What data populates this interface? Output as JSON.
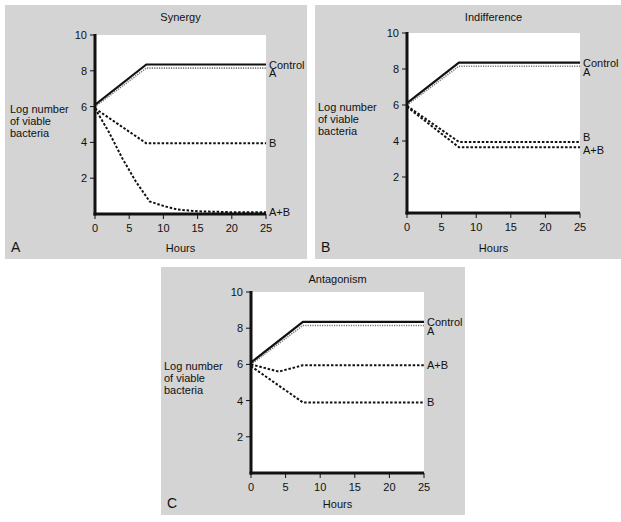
{
  "colors": {
    "panel_bg": "#d4d4d4",
    "plot_bg": "#ffffff",
    "line": "#111111",
    "line_light": "#777777"
  },
  "chart_data": [
    {
      "id": "A",
      "type": "line",
      "panel_label": "A",
      "title": "Synergy",
      "xlabel": "Hours",
      "ylabel": "Log number of viable bacteria",
      "ylabel_lines": [
        "Log number",
        "of viable",
        "bacteria"
      ],
      "xlim": [
        0,
        25
      ],
      "ylim": [
        0,
        10
      ],
      "xticks": [
        0,
        5,
        10,
        15,
        20,
        25
      ],
      "yticks": [
        2,
        4,
        6,
        8,
        10
      ],
      "grid": false,
      "series": [
        {
          "name": "Control",
          "style": "solid",
          "x": [
            0,
            7.5,
            25
          ],
          "y": [
            6.1,
            8.35,
            8.35
          ]
        },
        {
          "name": "A",
          "style": "dotted-light",
          "x": [
            0,
            7.5,
            25
          ],
          "y": [
            6.0,
            8.15,
            8.15
          ]
        },
        {
          "name": "B",
          "style": "dashed",
          "x": [
            0,
            7.5,
            25
          ],
          "y": [
            5.9,
            3.95,
            3.95
          ]
        },
        {
          "name": "A+B",
          "style": "dashed",
          "x": [
            0,
            2,
            4,
            6,
            8,
            10,
            12,
            15,
            20,
            25
          ],
          "y": [
            5.9,
            4.6,
            3.1,
            1.8,
            0.7,
            0.45,
            0.25,
            0.15,
            0.1,
            0.1
          ]
        }
      ],
      "series_labels": [
        {
          "text": "Control",
          "y": 8.35
        },
        {
          "text": "A",
          "y": 7.85
        },
        {
          "text": "B",
          "y": 3.95
        },
        {
          "text": "A+B",
          "y": 0.1
        }
      ]
    },
    {
      "id": "B",
      "type": "line",
      "panel_label": "B",
      "title": "Indifference",
      "xlabel": "Hours",
      "ylabel": "Log number of viable bacteria",
      "ylabel_lines": [
        "Log number",
        "of viable",
        "bacteria"
      ],
      "xlim": [
        0,
        25
      ],
      "ylim": [
        0,
        10
      ],
      "xticks": [
        0,
        5,
        10,
        15,
        20,
        25
      ],
      "yticks": [
        2,
        4,
        6,
        8,
        10
      ],
      "grid": false,
      "series": [
        {
          "name": "Control",
          "style": "solid",
          "x": [
            0,
            7.5,
            25
          ],
          "y": [
            6.1,
            8.35,
            8.35
          ]
        },
        {
          "name": "A",
          "style": "dotted-light",
          "x": [
            0,
            7.5,
            25
          ],
          "y": [
            6.0,
            8.15,
            8.15
          ]
        },
        {
          "name": "B",
          "style": "dashed",
          "x": [
            0,
            7.5,
            25
          ],
          "y": [
            5.95,
            3.95,
            3.95
          ]
        },
        {
          "name": "A+B",
          "style": "dashed",
          "x": [
            0,
            7.5,
            25
          ],
          "y": [
            5.9,
            3.65,
            3.65
          ]
        }
      ],
      "series_labels": [
        {
          "text": "Control",
          "y": 8.35
        },
        {
          "text": "A",
          "y": 7.85
        },
        {
          "text": "B",
          "y": 4.2
        },
        {
          "text": "A+B",
          "y": 3.5
        }
      ]
    },
    {
      "id": "C",
      "type": "line",
      "panel_label": "C",
      "title": "Antagonism",
      "xlabel": "Hours",
      "ylabel": "Log number of viable bacteria",
      "ylabel_lines": [
        "Log number",
        "of viable",
        "bacteria"
      ],
      "xlim": [
        0,
        25
      ],
      "ylim": [
        0,
        10
      ],
      "xticks": [
        0,
        5,
        10,
        15,
        20,
        25
      ],
      "yticks": [
        2,
        4,
        6,
        8,
        10
      ],
      "grid": false,
      "series": [
        {
          "name": "Control",
          "style": "solid",
          "x": [
            0,
            7.5,
            25
          ],
          "y": [
            6.1,
            8.35,
            8.35
          ]
        },
        {
          "name": "A",
          "style": "dotted-light",
          "x": [
            0,
            7.5,
            25
          ],
          "y": [
            6.0,
            8.15,
            8.15
          ]
        },
        {
          "name": "A+B",
          "style": "dashed",
          "x": [
            0,
            4,
            7.5,
            25
          ],
          "y": [
            6.0,
            5.6,
            5.95,
            5.95
          ]
        },
        {
          "name": "B",
          "style": "dashed",
          "x": [
            0,
            7.5,
            25
          ],
          "y": [
            5.9,
            3.9,
            3.9
          ]
        }
      ],
      "series_labels": [
        {
          "text": "Control",
          "y": 8.35
        },
        {
          "text": "A",
          "y": 7.85
        },
        {
          "text": "A+B",
          "y": 5.95
        },
        {
          "text": "B",
          "y": 3.9
        }
      ]
    }
  ],
  "layout": [
    {
      "panel": {
        "x": 5,
        "y": 5,
        "w": 302,
        "h": 254
      },
      "plot": {
        "x0": 95,
        "y0": 35,
        "x1": 266,
        "y1": 214
      }
    },
    {
      "panel": {
        "x": 315,
        "y": 5,
        "w": 306,
        "h": 254
      },
      "plot": {
        "x0": 407,
        "y0": 33,
        "x1": 580,
        "y1": 213
      }
    },
    {
      "panel": {
        "x": 161,
        "y": 267,
        "w": 304,
        "h": 248
      },
      "plot": {
        "x0": 251,
        "y0": 292,
        "x1": 424,
        "y1": 473
      }
    }
  ]
}
